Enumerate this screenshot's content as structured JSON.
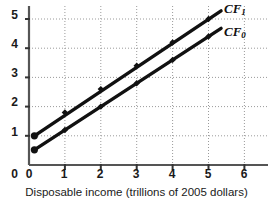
{
  "chart_data": {
    "type": "line",
    "title": "",
    "subtitle": "",
    "xlabel": "Disposable income (trillions of 2005 dollars)",
    "ylabel": "",
    "xlim": [
      0,
      6.5
    ],
    "ylim": [
      0,
      5.4
    ],
    "xticks": [
      "0",
      "1",
      "2",
      "3",
      "4",
      "5",
      "6"
    ],
    "yticks": [
      "0",
      "1",
      "2",
      "3",
      "4",
      "5"
    ],
    "xtick_values": [
      0,
      1,
      2,
      3,
      4,
      5,
      6
    ],
    "ytick_values": [
      0,
      1,
      2,
      3,
      4,
      5
    ],
    "grid": true,
    "grid_style": "dotted",
    "grid_color": "#9a9a9a",
    "legend": "inline-end-labels",
    "line_color": "#111111",
    "marker": "diamond",
    "axis_color": "#555555",
    "background": "#ffffff",
    "series": [
      {
        "name": "CF1",
        "label_text": "CF",
        "label_sub": "1",
        "x": [
          0.15,
          1,
          2,
          3,
          4,
          5
        ],
        "values": [
          1.0,
          1.8,
          2.6,
          3.4,
          4.2,
          5.0
        ],
        "x_end": 5.35,
        "y_end": 5.28,
        "intercept": 1.0,
        "slope": 0.8,
        "marker_x": [
          0.15,
          1,
          2,
          3,
          4,
          5
        ],
        "marker_y": [
          1.0,
          1.8,
          2.6,
          3.4,
          4.2,
          5.0
        ]
      },
      {
        "name": "CF0",
        "label_text": "CF",
        "label_sub": "0",
        "x": [
          0.15,
          1,
          2,
          3,
          4,
          5
        ],
        "values": [
          0.52,
          1.2,
          2.0,
          2.8,
          3.6,
          4.4
        ],
        "x_end": 5.35,
        "y_end": 4.68,
        "intercept": 0.4,
        "slope": 0.8,
        "marker_x": [
          0.15,
          1,
          2,
          3,
          4,
          5
        ],
        "marker_y": [
          0.52,
          1.2,
          2.0,
          2.8,
          3.6,
          4.4
        ]
      }
    ]
  },
  "axis": {
    "x_title": "Disposable income (trillions of 2005 dollars)",
    "y_tick_5": "5",
    "y_tick_4": "4",
    "y_tick_3": "3",
    "y_tick_2": "2",
    "y_tick_1": "1",
    "y_tick_0": "0",
    "x_tick_0": "0",
    "x_tick_1": "1",
    "x_tick_2": "2",
    "x_tick_3": "3",
    "x_tick_4": "4",
    "x_tick_5": "5",
    "x_tick_6": "6"
  },
  "labels": {
    "cf1_text": "CF",
    "cf1_sub": "1",
    "cf0_text": "CF",
    "cf0_sub": "0"
  }
}
